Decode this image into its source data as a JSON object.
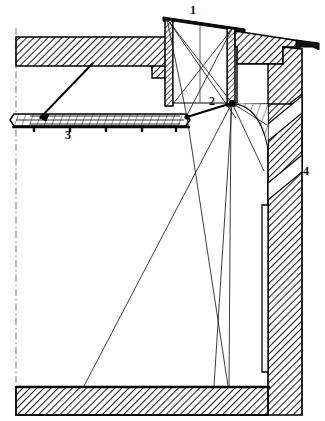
{
  "figure": {
    "type": "line-drawing-cross-section",
    "width": 325,
    "height": 421,
    "background_color": "#ffffff",
    "ink_color": "#000000",
    "hatch_color": "#1a1a1a"
  },
  "callouts": [
    {
      "id": "1",
      "label": "1",
      "x": 190,
      "y": 4,
      "refers_to": "lantern-skylight-roof"
    },
    {
      "id": "2",
      "label": "2",
      "x": 209,
      "y": 95,
      "refers_to": "dome-springing-node"
    },
    {
      "id": "3",
      "label": "3",
      "x": 65,
      "y": 129,
      "refers_to": "suspended-ceiling-panel"
    },
    {
      "id": "4",
      "label": "4",
      "x": 303,
      "y": 165,
      "refers_to": "exterior-wall-section"
    }
  ],
  "parts": {
    "centerline": {
      "name": "vertical-symmetry-axis",
      "x": 16,
      "y_top": 28,
      "y_bottom": 415,
      "style": "dash-dot"
    },
    "roof_slab": {
      "name": "upper-roof-slab",
      "fill": "hatch-45",
      "left": 16,
      "top": 37,
      "right": 166,
      "bottom": 66
    },
    "lantern": {
      "name": "lantern-skylight",
      "top_y": 18,
      "left_x": 165,
      "right_x": 233,
      "base_y": 104
    },
    "ceiling_panel": {
      "name": "suspended-ceiling-panel",
      "left": 14,
      "right": 190,
      "top": 112,
      "bottom": 126
    },
    "right_wall": {
      "name": "exterior-wall-section",
      "left": 268,
      "right": 302,
      "top": 44,
      "bottom": 415,
      "fill": "hatch-45"
    },
    "floor_slab": {
      "name": "floor-slab",
      "left": 16,
      "right": 312,
      "top": 387,
      "bottom": 415,
      "fill": "hatch-45"
    },
    "cornice": {
      "name": "cornice-overhang",
      "tip_x": 318,
      "tip_y": 38
    }
  },
  "sightlines": {
    "name": "sightline-rays",
    "origin_top": {
      "x": 166,
      "y": 19
    },
    "origin_node": {
      "x": 232,
      "y": 103
    },
    "origin_left": {
      "x": 186,
      "y": 117
    },
    "count": 9,
    "description": "Thin straight construction / sightline rays radiating from the lantern aperture into the hall interior"
  }
}
